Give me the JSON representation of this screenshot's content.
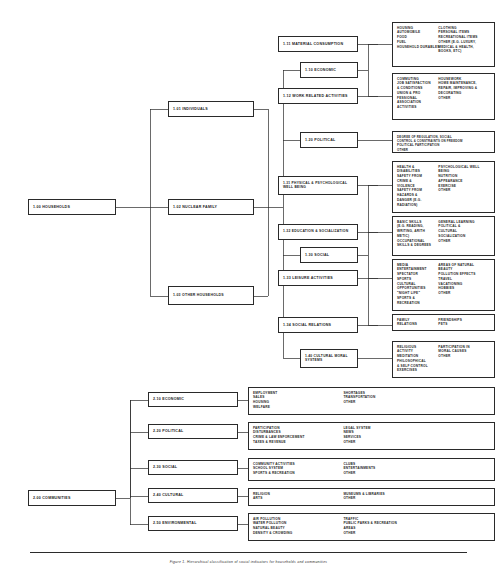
{
  "figure": {
    "caption": "Figure 1. Hierarchical classification of social indicators for households and communities",
    "domain_title": "Social Indicators Hierarchy"
  },
  "households": {
    "root": "1.00 HOUSEHOLDS",
    "level2": [
      {
        "id": "n101",
        "label": "1.01 INDIVIDUALS"
      },
      {
        "id": "n102",
        "label": "1.02 NUCLEAR FAMILY"
      },
      {
        "id": "n103",
        "label": "1.03 OTHER HOUSEHOLDS"
      }
    ],
    "level3": [
      {
        "id": "n110",
        "label": "1.10 ECONOMIC"
      },
      {
        "id": "n120",
        "label": "1.20 POLITICAL"
      },
      {
        "id": "n130",
        "label": "1.30 SOCIAL"
      },
      {
        "id": "n140",
        "label": "1.40 CULTURAL MORAL SYSTEMS"
      }
    ],
    "level4": [
      {
        "id": "n111",
        "label": "1.11 MATERIAL CONSUMPTION"
      },
      {
        "id": "n112",
        "label": "1.12 WORK RELATED ACTIVITIES"
      },
      {
        "id": "n131",
        "label": "1.31 PHYSICAL & PSYCHOLOGICAL WELL BEING"
      },
      {
        "id": "n132",
        "label": "1.32 EDUCATION & SOCIALIZATION"
      },
      {
        "id": "n133",
        "label": "1.33 LEISURE ACTIVITIES"
      },
      {
        "id": "n134",
        "label": "1.34 SOCIAL RELATIONS"
      }
    ]
  },
  "communities": {
    "root": "2.00 COMMUNITIES",
    "level2": [
      {
        "id": "n210",
        "label": "2.10 ECONOMIC"
      },
      {
        "id": "n220",
        "label": "2.20 POLITICAL"
      },
      {
        "id": "n230",
        "label": "2.30 SOCIAL"
      },
      {
        "id": "n240",
        "label": "2.40 CULTURAL"
      },
      {
        "id": "n250",
        "label": "2.50 ENVIRONMENTAL"
      }
    ]
  },
  "details": {
    "d111": {
      "left": [
        "HOUSING",
        "AUTOMOBILE",
        "FOOD",
        "FUEL",
        "HOUSEHOLD DURABLES"
      ],
      "right": [
        "CLOTHING",
        "PERSONAL ITEMS",
        "RECREATIONAL ITEMS",
        "OTHER (E.G. LUXURY,",
        "MEDICAL & HEALTH,",
        "BOOKS, ETC)"
      ]
    },
    "d112": {
      "left": [
        "COMMUTING",
        "JOB SATISFACTION",
        "& CONDITIONS",
        "UNION & PRO",
        "FESSIONAL",
        "ASSOCIATION",
        "ACTIVITIES"
      ],
      "right": [
        "HOUSEWORK",
        "HOME MAINTENANCE,",
        "REPAIR, IMPROVING &",
        "DECORATING",
        "OTHER"
      ]
    },
    "d120": {
      "left": [
        "DEGREE OF REGULATION, SOCIAL",
        "CONTROL & CONSTRAINTS ON FREEDOM",
        "POLITICAL PARTICIPATION",
        "OTHER"
      ],
      "right": []
    },
    "d131": {
      "left": [
        "HEALTH &",
        "DISABILITIES",
        "SAFETY FROM",
        "CRIME &",
        "VIOLENCE",
        "SAFETY FROM",
        "HAZARDS &",
        "DANGER (E.G.",
        "RADIATION)"
      ],
      "right": [
        "PSYCHOLOGICAL WELL",
        "BEING",
        "NUTRITION",
        "APPEARANCE",
        "EXERCISE",
        "OTHER"
      ]
    },
    "d132": {
      "left": [
        "BASIC SKILLS",
        "(E.G. READING,",
        "WRITING, ARITH",
        "METIC)",
        "OCCUPATIONAL",
        "SKILLS & DEGREES"
      ],
      "right": [
        "GENERAL LEARNING",
        "POLITICAL &",
        "CULTURAL",
        "SOCIALIZATION",
        "OTHER"
      ]
    },
    "d133": {
      "left": [
        "MEDIA",
        "ENTERTAINMENT",
        "SPECTATOR",
        "SPORTS",
        "CULTURAL",
        "OPPORTUNITIES",
        "\"NIGHT LIFE\"",
        "SPORTS &",
        "RECREATION"
      ],
      "right": [
        "AREAS OF NATURAL",
        "BEAUTY",
        "POLLUTION EFFECTS",
        "TRAVEL",
        "VACATIONING",
        "HOBBIES",
        "OTHER"
      ]
    },
    "d134": {
      "left": [
        "FAMILY",
        "RELATIONS"
      ],
      "right": [
        "FRIENDSHIPS",
        "PETS"
      ]
    },
    "d140": {
      "left": [
        "RELIGIOUS",
        "ACTIVITY",
        "MEDITATION",
        "PHILOSOPHICAL",
        "& SELF CONTROL",
        "EXERCISES"
      ],
      "right": [
        "PARTICIPATION IN",
        "MORAL CAUSES",
        "OTHER"
      ]
    },
    "d210": {
      "left": [
        "EMPLOYMENT",
        "SALES",
        "HOUSING",
        "WELFARE"
      ],
      "right": [
        "SHORTAGES",
        "TRANSPORTATION",
        "OTHER"
      ]
    },
    "d220": {
      "left": [
        "PARTICIPATION",
        "DISTURBANCES",
        "CRIME & LAW ENFORCEMENT",
        "TAXES & REVENUE"
      ],
      "right": [
        "LEGAL SYSTEM",
        "NEWS",
        "SERVICES",
        "OTHER"
      ]
    },
    "d230": {
      "left": [
        "COMMUNITY ACTIVITIES",
        "SCHOOL SYSTEM",
        "SPORTS & RECREATION"
      ],
      "right": [
        "CLUBS",
        "ENTERTAINMENTS",
        "OTHER"
      ]
    },
    "d240": {
      "left": [
        "RELIGION",
        "ARTS"
      ],
      "right": [
        "MUSEUMS & LIBRARIES",
        "OTHER"
      ]
    },
    "d250": {
      "left": [
        "AIR POLLUTION",
        "WATER POLLUTION",
        "NATURAL BEAUTY",
        "DENSITY & CROWDING"
      ],
      "right": [
        "TRAFFIC",
        "PUBLIC PARKS & RECREATION",
        "AREAS",
        "OTHER"
      ]
    }
  },
  "colors": {
    "ink": "#2a2a2a",
    "paper": "#ffffff"
  }
}
